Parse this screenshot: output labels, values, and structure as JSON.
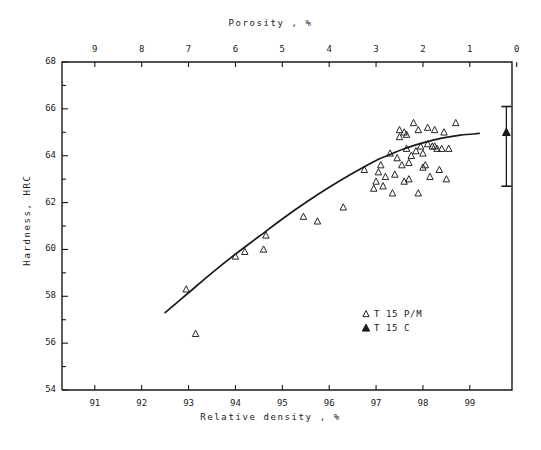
{
  "chart_data": {
    "type": "scatter",
    "title": "",
    "xlabel": "Relative density , %",
    "ylabel": "Hardness, HRC",
    "top_xlabel": "Porosity , %",
    "xlim": [
      90.3,
      99.9
    ],
    "ylim": [
      54,
      68
    ],
    "top_xlim": [
      9.7,
      0.1
    ],
    "grid": false,
    "x_ticks": [
      91,
      92,
      93,
      94,
      95,
      96,
      97,
      98,
      99
    ],
    "x_tick_labels": [
      "91",
      "92",
      "93",
      "94",
      "95",
      "96",
      "97",
      "98",
      "99"
    ],
    "y_ticks": [
      54,
      55,
      56,
      57,
      58,
      59,
      60,
      61,
      62,
      63,
      64,
      65,
      66,
      67,
      68
    ],
    "y_tick_labels": [
      "54",
      "",
      "56",
      "",
      "58",
      "",
      "60",
      "",
      "62",
      "",
      "64",
      "",
      "66",
      "",
      "68"
    ],
    "top_x_ticks": [
      9,
      8,
      7,
      6,
      5,
      4,
      3,
      2,
      1,
      0
    ],
    "top_x_tick_labels": [
      "9",
      "8",
      "7",
      "6",
      "5",
      "4",
      "3",
      "2",
      "1",
      "0"
    ],
    "legend_position": "lower-right",
    "series": [
      {
        "name": "T 15 P/M",
        "marker": "open-triangle",
        "color": "#1a1a1a",
        "points": [
          [
            92.95,
            58.3
          ],
          [
            93.15,
            56.4
          ],
          [
            94.0,
            59.7
          ],
          [
            94.2,
            59.9
          ],
          [
            94.6,
            60.0
          ],
          [
            94.65,
            60.6
          ],
          [
            95.45,
            61.4
          ],
          [
            95.75,
            61.2
          ],
          [
            96.3,
            61.8
          ],
          [
            96.75,
            63.4
          ],
          [
            96.95,
            62.6
          ],
          [
            97.0,
            62.9
          ],
          [
            97.05,
            63.3
          ],
          [
            97.1,
            63.6
          ],
          [
            97.15,
            62.7
          ],
          [
            97.2,
            63.1
          ],
          [
            97.3,
            64.1
          ],
          [
            97.35,
            62.4
          ],
          [
            97.4,
            63.2
          ],
          [
            97.45,
            63.9
          ],
          [
            97.5,
            64.8
          ],
          [
            97.5,
            65.1
          ],
          [
            97.55,
            63.6
          ],
          [
            97.6,
            65.0
          ],
          [
            97.6,
            62.9
          ],
          [
            97.65,
            64.9
          ],
          [
            97.65,
            64.3
          ],
          [
            97.7,
            63.0
          ],
          [
            97.7,
            63.7
          ],
          [
            97.75,
            64.0
          ],
          [
            97.8,
            65.4
          ],
          [
            97.85,
            64.2
          ],
          [
            97.9,
            65.1
          ],
          [
            97.9,
            62.4
          ],
          [
            97.95,
            64.4
          ],
          [
            98.0,
            63.5
          ],
          [
            98.0,
            64.1
          ],
          [
            98.05,
            63.6
          ],
          [
            98.1,
            65.2
          ],
          [
            98.1,
            64.5
          ],
          [
            98.15,
            63.1
          ],
          [
            98.2,
            64.4
          ],
          [
            98.25,
            65.1
          ],
          [
            98.25,
            64.4
          ],
          [
            98.3,
            64.3
          ],
          [
            98.35,
            63.4
          ],
          [
            98.4,
            64.3
          ],
          [
            98.45,
            65.0
          ],
          [
            98.5,
            63.0
          ],
          [
            98.55,
            64.3
          ],
          [
            98.7,
            65.4
          ]
        ]
      },
      {
        "name": "T 15 C",
        "marker": "filled-triangle",
        "color": "#1a1a1a",
        "points": [
          [
            99.78,
            65.0
          ]
        ],
        "error_bar": {
          "x": 99.78,
          "low": 62.7,
          "high": 66.1
        }
      }
    ],
    "trend_line": {
      "name": "fitted-curve",
      "color": "#1a1a1a",
      "points": [
        [
          92.5,
          57.3
        ],
        [
          93.0,
          58.15
        ],
        [
          93.5,
          59.0
        ],
        [
          94.0,
          59.8
        ],
        [
          94.5,
          60.55
        ],
        [
          95.0,
          61.3
        ],
        [
          95.5,
          62.0
        ],
        [
          96.0,
          62.65
        ],
        [
          96.5,
          63.25
        ],
        [
          97.0,
          63.8
        ],
        [
          97.3,
          64.05
        ],
        [
          97.6,
          64.3
        ],
        [
          98.0,
          64.55
        ],
        [
          98.4,
          64.75
        ],
        [
          98.8,
          64.88
        ],
        [
          99.2,
          64.95
        ]
      ]
    }
  },
  "legend": {
    "items": [
      {
        "label": "T 15  P/M",
        "marker": "open-triangle"
      },
      {
        "label": "T 15  C",
        "marker": "filled-triangle"
      }
    ]
  }
}
